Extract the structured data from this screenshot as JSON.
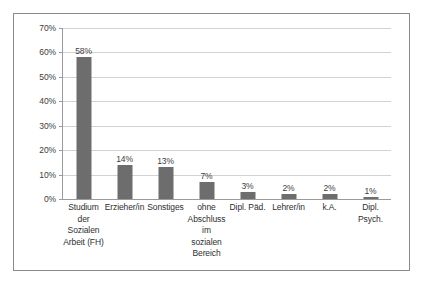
{
  "chart_data": {
    "type": "bar",
    "title": "",
    "subtitle": "",
    "xlabel": "",
    "ylabel": "",
    "ylim": [
      0,
      70
    ],
    "grid": true,
    "legend": false,
    "y_ticks": [
      "0%",
      "10%",
      "20%",
      "30%",
      "40%",
      "50%",
      "60%",
      "70%"
    ],
    "y_tick_values": [
      0,
      10,
      20,
      30,
      40,
      50,
      60,
      70
    ],
    "categories": [
      [
        "Studium",
        "der",
        "Sozialen",
        "Arbeit (FH)"
      ],
      [
        "Erzieher/in"
      ],
      [
        "Sonstiges"
      ],
      [
        "ohne",
        "Abschluss",
        "im",
        "sozialen",
        "Bereich"
      ],
      [
        "Dipl. Päd."
      ],
      [
        "Lehrer/in"
      ],
      [
        "k.A."
      ],
      [
        "Dipl.",
        "Psych."
      ]
    ],
    "category_labels": [
      "Studium der Sozialen Arbeit (FH)",
      "Erzieher/in",
      "Sonstiges",
      "ohne Abschluss im sozialen Bereich",
      "Dipl. Päd.",
      "Lehrer/in",
      "k.A.",
      "Dipl. Psych."
    ],
    "values": [
      58,
      14,
      13,
      7,
      3,
      2,
      2,
      1
    ],
    "data_labels": [
      "58%",
      "14%",
      "13%",
      "7%",
      "3%",
      "2%",
      "2%",
      "1%"
    ],
    "bar_color": "#6d6d6d",
    "gridline_color": "#d2d2d2",
    "axis_color": "#9a9a9a",
    "plot_background": "#ffffff",
    "frame_border_color": "#8a8a8a"
  }
}
